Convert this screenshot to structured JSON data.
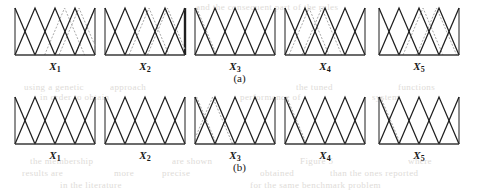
{
  "figure": {
    "type": "fuzzy-membership-function-panels",
    "captions": {
      "a": "(a)",
      "b": "(b)"
    },
    "variable_labels": [
      "X",
      "X",
      "X",
      "X",
      "X"
    ],
    "variable_subscripts": [
      "1",
      "2",
      "3",
      "4",
      "5"
    ],
    "colors": {
      "solid_line": "#1f1f1f",
      "dashed_line": "#a9a9a9",
      "baseline": "#3a3a3a",
      "background": "#ffffff",
      "ghost_text": "#d9d6d2"
    },
    "panel_geometry": {
      "panel_width": 84,
      "panel_height": 52,
      "panel_x_positions": [
        13,
        103,
        193,
        283,
        377
      ],
      "row_a_top": 6,
      "row_b_top": 95
    },
    "rows": [
      {
        "id": "a",
        "caption": "(a)",
        "panels": [
          {
            "label": "X",
            "subscript": "1",
            "solid_peaks": [
              0.0,
              0.25,
              0.5,
              0.75,
              1.0
            ],
            "dashed_peaks": [
              0.62,
              0.8,
              1.0
            ],
            "right_edge_bar": false
          },
          {
            "label": "X",
            "subscript": "2",
            "solid_peaks": [
              0.0,
              0.25,
              0.5,
              0.75,
              1.0
            ],
            "dashed_peaks": [
              0.55,
              0.78,
              1.0
            ],
            "right_edge_bar": true
          },
          {
            "label": "X",
            "subscript": "3",
            "solid_peaks": [
              0.0,
              0.25,
              0.5,
              0.75,
              1.0
            ],
            "dashed_peaks": [
              0.02
            ],
            "right_edge_bar": false
          },
          {
            "label": "X",
            "subscript": "4",
            "solid_peaks": [
              0.0,
              0.25,
              0.5,
              0.75,
              1.0
            ],
            "dashed_peaks": [
              0.3,
              0.46
            ],
            "right_edge_bar": false
          },
          {
            "label": "X",
            "subscript": "5",
            "solid_peaks": [
              0.0,
              0.25,
              0.5,
              0.75,
              1.0
            ],
            "dashed_peaks": [
              0.55,
              0.72
            ],
            "right_edge_bar": false
          }
        ]
      },
      {
        "id": "b",
        "caption": "(b)",
        "panels": [
          {
            "label": "X",
            "subscript": "1",
            "solid_peaks": [
              0.0,
              0.25,
              0.5,
              0.75,
              1.0
            ],
            "dashed_peaks": [],
            "right_edge_bar": false
          },
          {
            "label": "X",
            "subscript": "2",
            "solid_peaks": [
              0.0,
              0.25,
              0.5,
              0.75,
              1.0
            ],
            "dashed_peaks": [],
            "right_edge_bar": false
          },
          {
            "label": "X",
            "subscript": "3",
            "solid_peaks": [
              0.0,
              0.25,
              0.5,
              0.75,
              1.0
            ],
            "dashed_peaks": [
              0.02,
              0.22
            ],
            "right_edge_bar": false
          },
          {
            "label": "X",
            "subscript": "4",
            "solid_peaks": [
              0.0,
              0.25,
              0.5,
              0.75,
              1.0
            ],
            "dashed_peaks": [
              0.02
            ],
            "right_edge_bar": false
          },
          {
            "label": "X",
            "subscript": "5",
            "solid_peaks": [
              0.0,
              0.25,
              0.5,
              0.75,
              1.0
            ],
            "dashed_peaks": [
              0.02
            ],
            "right_edge_bar": false
          }
        ]
      }
    ]
  },
  "chart_data": {
    "type": "line",
    "title": "",
    "subtitle": "",
    "xlabel": "",
    "ylabel": "",
    "xlim": [
      0,
      1
    ],
    "ylim": [
      0,
      1
    ],
    "grid": false,
    "legend": "none",
    "panels": [
      {
        "panel": "a1",
        "row": "(a)",
        "variable": "X1",
        "series": [
          {
            "name": "solid",
            "style": "solid",
            "peaks": [
              0.0,
              0.25,
              0.5,
              0.75,
              1.0
            ],
            "values": [
              1,
              1,
              1,
              1,
              1
            ]
          },
          {
            "name": "dashed",
            "style": "dashed",
            "peaks": [
              0.62,
              0.8,
              1.0
            ],
            "values": [
              1,
              1,
              1
            ]
          }
        ]
      },
      {
        "panel": "a2",
        "row": "(a)",
        "variable": "X2",
        "series": [
          {
            "name": "solid",
            "style": "solid",
            "peaks": [
              0.0,
              0.25,
              0.5,
              0.75,
              1.0
            ],
            "values": [
              1,
              1,
              1,
              1,
              1
            ]
          },
          {
            "name": "dashed",
            "style": "dashed",
            "peaks": [
              0.55,
              0.78,
              1.0
            ],
            "values": [
              1,
              1,
              1
            ]
          }
        ]
      },
      {
        "panel": "a3",
        "row": "(a)",
        "variable": "X3",
        "series": [
          {
            "name": "solid",
            "style": "solid",
            "peaks": [
              0.0,
              0.25,
              0.5,
              0.75,
              1.0
            ],
            "values": [
              1,
              1,
              1,
              1,
              1
            ]
          },
          {
            "name": "dashed",
            "style": "dashed",
            "peaks": [
              0.02
            ],
            "values": [
              1
            ]
          }
        ]
      },
      {
        "panel": "a4",
        "row": "(a)",
        "variable": "X4",
        "series": [
          {
            "name": "solid",
            "style": "solid",
            "peaks": [
              0.0,
              0.25,
              0.5,
              0.75,
              1.0
            ],
            "values": [
              1,
              1,
              1,
              1,
              1
            ]
          },
          {
            "name": "dashed",
            "style": "dashed",
            "peaks": [
              0.3,
              0.46
            ],
            "values": [
              1,
              1
            ]
          }
        ]
      },
      {
        "panel": "a5",
        "row": "(a)",
        "variable": "X5",
        "series": [
          {
            "name": "solid",
            "style": "solid",
            "peaks": [
              0.0,
              0.25,
              0.5,
              0.75,
              1.0
            ],
            "values": [
              1,
              1,
              1,
              1,
              1
            ]
          },
          {
            "name": "dashed",
            "style": "dashed",
            "peaks": [
              0.55,
              0.72
            ],
            "values": [
              1,
              1
            ]
          }
        ]
      },
      {
        "panel": "b1",
        "row": "(b)",
        "variable": "X1",
        "series": [
          {
            "name": "solid",
            "style": "solid",
            "peaks": [
              0.0,
              0.25,
              0.5,
              0.75,
              1.0
            ],
            "values": [
              1,
              1,
              1,
              1,
              1
            ]
          }
        ]
      },
      {
        "panel": "b2",
        "row": "(b)",
        "variable": "X2",
        "series": [
          {
            "name": "solid",
            "style": "solid",
            "peaks": [
              0.0,
              0.25,
              0.5,
              0.75,
              1.0
            ],
            "values": [
              1,
              1,
              1,
              1,
              1
            ]
          }
        ]
      },
      {
        "panel": "b3",
        "row": "(b)",
        "variable": "X3",
        "series": [
          {
            "name": "solid",
            "style": "solid",
            "peaks": [
              0.0,
              0.25,
              0.5,
              0.75,
              1.0
            ],
            "values": [
              1,
              1,
              1,
              1,
              1
            ]
          },
          {
            "name": "dashed",
            "style": "dashed",
            "peaks": [
              0.02,
              0.22
            ],
            "values": [
              1,
              1
            ]
          }
        ]
      },
      {
        "panel": "b4",
        "row": "(b)",
        "variable": "X4",
        "series": [
          {
            "name": "solid",
            "style": "solid",
            "peaks": [
              0.0,
              0.25,
              0.5,
              0.75,
              1.0
            ],
            "values": [
              1,
              1,
              1,
              1,
              1
            ]
          },
          {
            "name": "dashed",
            "style": "dashed",
            "peaks": [
              0.02
            ],
            "values": [
              1
            ]
          }
        ]
      },
      {
        "panel": "b5",
        "row": "(b)",
        "variable": "X5",
        "series": [
          {
            "name": "solid",
            "style": "solid",
            "peaks": [
              0.0,
              0.25,
              0.5,
              0.75,
              1.0
            ],
            "values": [
              1,
              1,
              1,
              1,
              1
            ]
          },
          {
            "name": "dashed",
            "style": "dashed",
            "peaks": [
              0.02
            ],
            "values": [
              1
            ]
          }
        ]
      }
    ]
  },
  "background_bleed_text": [
    {
      "text": "and the consequent part of the rules",
      "x": 196,
      "y": 2
    },
    {
      "text": "using a genetic",
      "x": 24,
      "y": 82
    },
    {
      "text": "approach",
      "x": 110,
      "y": 82
    },
    {
      "text": "the tuned",
      "x": 296,
      "y": 82
    },
    {
      "text": "functions",
      "x": 398,
      "y": 82
    },
    {
      "text": "in order to obtain",
      "x": 40,
      "y": 92
    },
    {
      "text": "performance of",
      "x": 240,
      "y": 92
    },
    {
      "text": "system",
      "x": 372,
      "y": 92
    },
    {
      "text": "the membership",
      "x": 30,
      "y": 156
    },
    {
      "text": "are shown",
      "x": 172,
      "y": 156
    },
    {
      "text": "Figure 5",
      "x": 300,
      "y": 156
    },
    {
      "text": "where",
      "x": 408,
      "y": 156
    },
    {
      "text": "results are",
      "x": 22,
      "y": 168
    },
    {
      "text": "more",
      "x": 114,
      "y": 168
    },
    {
      "text": "precise",
      "x": 162,
      "y": 168
    },
    {
      "text": "obtained",
      "x": 260,
      "y": 168
    },
    {
      "text": "than the ones reported",
      "x": 330,
      "y": 168
    },
    {
      "text": "in the literature",
      "x": 60,
      "y": 180
    },
    {
      "text": "for the same benchmark problem",
      "x": 250,
      "y": 180
    }
  ]
}
